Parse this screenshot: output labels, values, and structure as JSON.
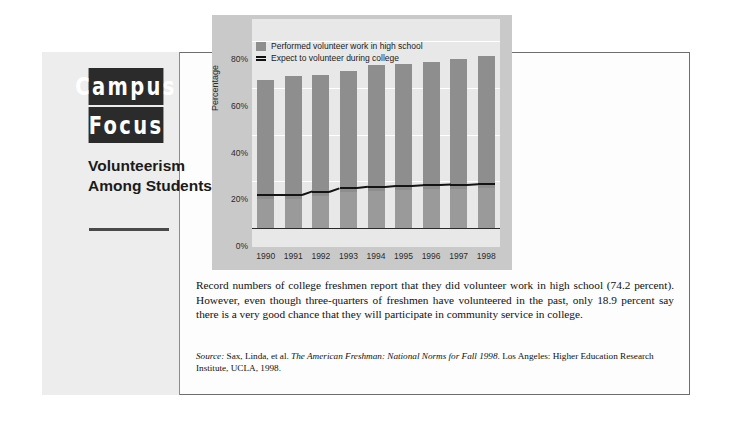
{
  "masthead": {
    "logo_line1": "Campus",
    "logo_line2": "Focus",
    "kicker": "Volunteerism Among Students"
  },
  "chart_data": {
    "type": "bar",
    "title": "",
    "xlabel": "",
    "ylabel": "Percentage",
    "ylim": [
      0,
      90
    ],
    "grid": true,
    "legend_position": "top-left",
    "categories": [
      "1990",
      "1991",
      "1992",
      "1993",
      "1994",
      "1995",
      "1996",
      "1997",
      "1998"
    ],
    "ytick_labels": [
      "0%",
      "20%",
      "40%",
      "60%",
      "80%"
    ],
    "ytick_values": [
      0,
      20,
      40,
      60,
      80
    ],
    "series": [
      {
        "name": "Performed volunteer work in high school",
        "type": "bar",
        "color": "#8e8e8e",
        "values": [
          64.0,
          65.6,
          66.0,
          67.8,
          70.5,
          70.6,
          71.4,
          72.8,
          74.2
        ]
      },
      {
        "name": "Expect to volunteer during college",
        "type": "line",
        "color": "#141414",
        "values": [
          14.0,
          14.0,
          15.6,
          17.2,
          17.7,
          18.1,
          18.4,
          18.6,
          18.9
        ]
      }
    ]
  },
  "legend": {
    "item1": "Performed volunteer work in high school",
    "item2": "Expect to volunteer during college"
  },
  "body": {
    "paragraph": "Record numbers of college freshmen report that they did volunteer work in high school (74.2 percent). However, even though three-quarters of freshmen have volunteered in the past, only 18.9 percent say there is a very good chance that they will participate in community service in college."
  },
  "source": {
    "label": "Source:",
    "authors": " Sax, Linda, et al. ",
    "title": "The American Freshman: National Norms for Fall 1998",
    "publisher": ". Los Angeles: Higher Education Research Institute, UCLA, 1998."
  }
}
